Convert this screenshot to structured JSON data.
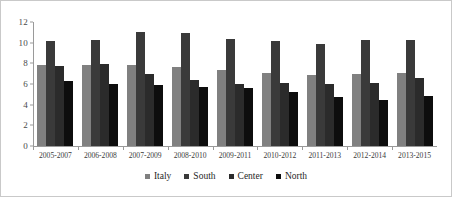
{
  "chart_data": {
    "type": "bar",
    "title": "",
    "xlabel": "",
    "ylabel": "",
    "ylim": [
      0,
      12
    ],
    "ytick_step": 2,
    "yticks": [
      12,
      10,
      8,
      6,
      4,
      2,
      0
    ],
    "grid": false,
    "legend_position": "bottom-center",
    "categories": [
      "2005-2007",
      "2006-2008",
      "2007-2009",
      "2008-2010",
      "2009-2011",
      "2010-2012",
      "2011-2013",
      "2012-2014",
      "2013-2015"
    ],
    "series": [
      {
        "name": "Italy",
        "color": "#808080",
        "values": [
          7.8,
          7.8,
          7.8,
          7.6,
          7.4,
          7.1,
          6.9,
          7.0,
          7.1
        ]
      },
      {
        "name": "South",
        "color": "#3a3a3a",
        "values": [
          10.2,
          10.3,
          11.0,
          10.9,
          10.4,
          10.2,
          9.9,
          10.3,
          10.3
        ]
      },
      {
        "name": "Center",
        "color": "#2b2b2b",
        "values": [
          7.7,
          7.9,
          7.0,
          6.4,
          6.0,
          6.1,
          6.0,
          6.1,
          6.6
        ]
      },
      {
        "name": "North",
        "color": "#0d0d0d",
        "values": [
          6.3,
          6.0,
          5.9,
          5.7,
          5.6,
          5.2,
          4.7,
          4.5,
          4.8
        ]
      }
    ]
  }
}
